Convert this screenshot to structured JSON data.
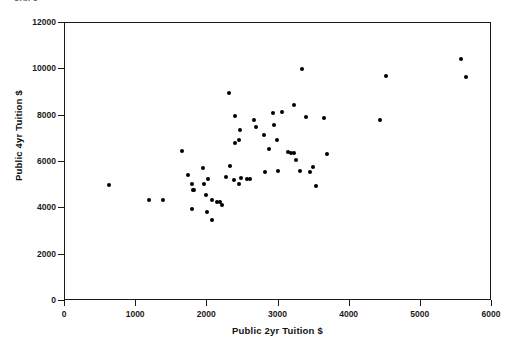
{
  "top_fragment": "stack",
  "chart_data": {
    "type": "scatter",
    "title": "",
    "xlabel": "Public 2yr Tuition $",
    "ylabel": "Public 4yr Tuition $",
    "xlim": [
      0,
      6000
    ],
    "ylim": [
      0,
      12000
    ],
    "xticks": [
      0,
      1000,
      2000,
      3000,
      4000,
      5000,
      6000
    ],
    "yticks": [
      0,
      2000,
      4000,
      6000,
      8000,
      10000,
      12000
    ],
    "grid": false,
    "legend": null,
    "marker": {
      "shape": "circle",
      "color": "#000000",
      "size": 4
    },
    "series": [
      {
        "name": "States",
        "points": [
          [
            620,
            5020
          ],
          [
            1180,
            4360
          ],
          [
            1375,
            4350
          ],
          [
            1645,
            6460
          ],
          [
            1735,
            5420
          ],
          [
            1790,
            5060
          ],
          [
            1800,
            4780
          ],
          [
            1815,
            4790
          ],
          [
            1790,
            3980
          ],
          [
            1945,
            5740
          ],
          [
            1960,
            5030
          ],
          [
            1975,
            4560
          ],
          [
            1995,
            3830
          ],
          [
            2010,
            5280
          ],
          [
            2065,
            3480
          ],
          [
            2070,
            4355
          ],
          [
            2135,
            4290
          ],
          [
            2180,
            4280
          ],
          [
            2200,
            4130
          ],
          [
            2265,
            5360
          ],
          [
            2300,
            8960
          ],
          [
            2320,
            5830
          ],
          [
            2370,
            5230
          ],
          [
            2390,
            8000
          ],
          [
            2395,
            6840
          ],
          [
            2445,
            5070
          ],
          [
            2450,
            6950
          ],
          [
            2455,
            7380
          ],
          [
            2475,
            5300
          ],
          [
            2560,
            5260
          ],
          [
            2600,
            5270
          ],
          [
            2660,
            7800
          ],
          [
            2690,
            7520
          ],
          [
            2795,
            7160
          ],
          [
            2810,
            5570
          ],
          [
            2860,
            6560
          ],
          [
            2920,
            8130
          ],
          [
            2940,
            7580
          ],
          [
            2980,
            6960
          ],
          [
            2990,
            5630
          ],
          [
            3055,
            8140
          ],
          [
            3135,
            6440
          ],
          [
            3180,
            6390
          ],
          [
            3215,
            6410
          ],
          [
            3220,
            8470
          ],
          [
            3250,
            6100
          ],
          [
            3300,
            5620
          ],
          [
            3330,
            10010
          ],
          [
            3380,
            7960
          ],
          [
            3445,
            5580
          ],
          [
            3490,
            5790
          ],
          [
            3520,
            4960
          ],
          [
            3640,
            7880
          ],
          [
            3675,
            6330
          ],
          [
            4420,
            7820
          ],
          [
            4510,
            9730
          ],
          [
            5570,
            10430
          ],
          [
            5640,
            9690
          ]
        ]
      }
    ]
  }
}
